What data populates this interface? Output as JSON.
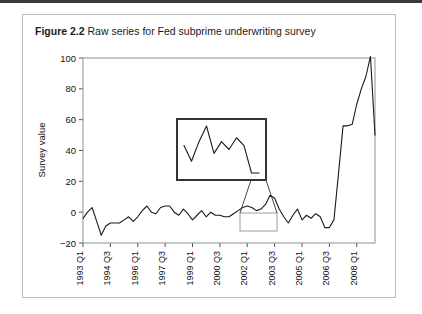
{
  "figure": {
    "label": "Figure 2.2",
    "caption": "Raw series for Fed subprime underwriting survey"
  },
  "colors": {
    "line": "#1a1a1a",
    "frame": "#8e9194",
    "card_border": "#b9bcc0",
    "top_rule": "#3a3a3a",
    "inset_border": "#333333",
    "highlight_border": "#9a9da0"
  },
  "chart_data": {
    "type": "line",
    "title": "Raw series for Fed subprime underwriting survey",
    "xlabel": "",
    "ylabel": "Survey value",
    "ylim": [
      -20,
      100
    ],
    "yticks": [
      -20,
      0,
      20,
      40,
      60,
      80,
      100
    ],
    "ytick_labels": [
      "−20",
      "0",
      "20",
      "40",
      "60",
      "80",
      "100"
    ],
    "grid": false,
    "legend": null,
    "xtick_labels": [
      "1993 Q1",
      "1994 Q3",
      "1996 Q1",
      "1997 Q3",
      "1999 Q1",
      "2000 Q3",
      "2002 Q1",
      "2003 Q3",
      "2005 Q1",
      "2006 Q3",
      "2008 Q1"
    ],
    "xtick_indices": [
      0,
      6,
      12,
      18,
      24,
      30,
      36,
      42,
      48,
      54,
      60
    ],
    "x": [
      "1993 Q1",
      "1993 Q2",
      "1993 Q3",
      "1993 Q4",
      "1994 Q1",
      "1994 Q2",
      "1994 Q3",
      "1994 Q4",
      "1995 Q1",
      "1995 Q2",
      "1995 Q3",
      "1995 Q4",
      "1996 Q1",
      "1996 Q2",
      "1996 Q3",
      "1996 Q4",
      "1997 Q1",
      "1997 Q2",
      "1997 Q3",
      "1997 Q4",
      "1998 Q1",
      "1998 Q2",
      "1998 Q3",
      "1998 Q4",
      "1999 Q1",
      "1999 Q2",
      "1999 Q3",
      "1999 Q4",
      "2000 Q1",
      "2000 Q2",
      "2000 Q3",
      "2000 Q4",
      "2001 Q1",
      "2001 Q2",
      "2001 Q3",
      "2001 Q4",
      "2002 Q1",
      "2002 Q2",
      "2002 Q3",
      "2002 Q4",
      "2003 Q1",
      "2003 Q2",
      "2003 Q3",
      "2003 Q4",
      "2004 Q1",
      "2004 Q2",
      "2004 Q3",
      "2004 Q4",
      "2005 Q1",
      "2005 Q2",
      "2005 Q3",
      "2005 Q4",
      "2006 Q1",
      "2006 Q2",
      "2006 Q3",
      "2006 Q4",
      "2007 Q1",
      "2007 Q2",
      "2007 Q3",
      "2007 Q4",
      "2008 Q1",
      "2008 Q2",
      "2008 Q3",
      "2008 Q4",
      "2009 Q1"
    ],
    "values": [
      -4,
      0,
      3,
      -6,
      -15,
      -9,
      -7,
      -7,
      -7,
      -5,
      -3,
      -6,
      -3,
      1,
      4,
      0,
      -1,
      3,
      4,
      4,
      0,
      -2,
      2,
      -1,
      -5,
      -2,
      1,
      -3,
      0,
      -2,
      -2,
      -3,
      -3,
      -1,
      1,
      3,
      4,
      3,
      1,
      2,
      5,
      11,
      9,
      2,
      -3,
      -7,
      -2,
      2,
      -5,
      -2,
      -4,
      -1,
      -3,
      -10,
      -10,
      -5,
      25,
      56,
      56,
      57,
      70,
      80,
      88,
      101,
      50
    ],
    "inset": {
      "note": "magnified view of highlighted region",
      "x_range": [
        "2004 Q1",
        "2006 Q3"
      ],
      "values": [
        -3,
        -7,
        -2,
        2,
        -5,
        -2,
        -4,
        -1,
        -3,
        -10,
        -10
      ]
    }
  }
}
